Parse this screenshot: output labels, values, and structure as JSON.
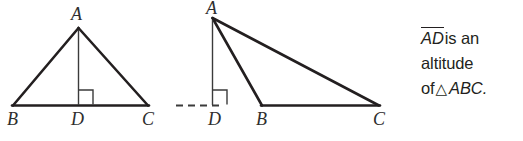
{
  "figure": {
    "background_color": "#ffffff",
    "stroke_color": "#231f20",
    "label_color": "#2e2e2e"
  },
  "triangles": [
    {
      "case": "acute",
      "labels": {
        "apex": "A",
        "left_base": "B",
        "foot": "D",
        "right_base": "C"
      },
      "altitude_inside": true,
      "dashed_extension": false,
      "right_angle_mark": true
    },
    {
      "case": "obtuse",
      "labels": {
        "apex": "A",
        "left_base": "B",
        "foot": "D",
        "right_base": "C"
      },
      "altitude_inside": false,
      "dashed_extension": true,
      "right_angle_mark": true
    }
  ],
  "caption": {
    "line1_segment": "AD",
    "line1_rest": "is an",
    "line2": "altitude",
    "line3_prefix": "of",
    "line3_symbol": "△",
    "line3_triangle": "ABC."
  }
}
